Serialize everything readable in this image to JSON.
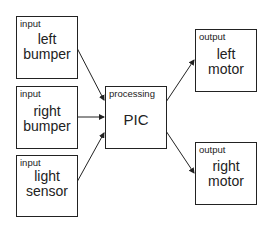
{
  "diagram": {
    "inputs": [
      {
        "tag": "input",
        "line1": "left",
        "line2": "bumper"
      },
      {
        "tag": "input",
        "line1": "right",
        "line2": "bumper"
      },
      {
        "tag": "input",
        "line1": "light",
        "line2": "sensor"
      }
    ],
    "processing": {
      "tag": "processing",
      "label": "PIC"
    },
    "outputs": [
      {
        "tag": "output",
        "line1": "left",
        "line2": "motor"
      },
      {
        "tag": "output",
        "line1": "right",
        "line2": "motor"
      }
    ],
    "connections": [
      {
        "from": "left bumper",
        "to": "PIC"
      },
      {
        "from": "right bumper",
        "to": "PIC"
      },
      {
        "from": "light sensor",
        "to": "PIC"
      },
      {
        "from": "PIC",
        "to": "left motor"
      },
      {
        "from": "PIC",
        "to": "right motor"
      }
    ]
  }
}
